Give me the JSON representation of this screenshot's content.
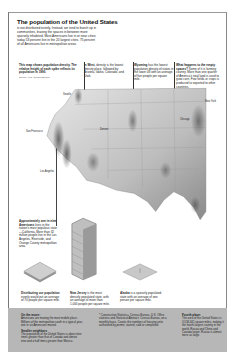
{
  "header": {
    "title": "The population of the United States",
    "intro": "is not distributed evenly. Instead, we tend to bunch up in communities, leaving the spaces in between more sparsely inhabited. Most Americans live in or near cities; today 53 percent live in the 20 largest cities. 75 percent of all Americans live in metropolitan areas."
  },
  "captions": [
    {
      "id": "map-intro",
      "bold": "This map shows population density. The relative height of each spike reflects its population in 1990.",
      "text": "",
      "source": "Source: U.S. Census Bureau"
    },
    {
      "id": "mid-west",
      "bold": "In West,",
      "text": "density is the lowest density place, followed by Arizona, Idaho, Colorado, and Utah."
    },
    {
      "id": "wyoming",
      "bold": "Wyoming",
      "text": "has the lowest population density of states in the lower 48 with an average of five people per square mile."
    },
    {
      "id": "what-happens",
      "bold": "What happens to the empty spaces?",
      "text": "Some of it is farming country. More than one quarter of America's total land is used to grow corn. Few fields or crops is produced to exported to other countries."
    },
    {
      "id": "manhattan",
      "bold": "Approximately one in nine Americans",
      "text": "lives in the nation's most populous state—California. More than 32 million people live in the Los Angeles, Riverside, and Orange County metropolitan area."
    },
    {
      "id": "distributing",
      "bold": "Distributing our population",
      "text": "evenly would put an average of 70 people per square mile."
    },
    {
      "id": "new-jersey",
      "bold": "New Jersey",
      "text": "is the most densely populated state, with an average of more than 1,000 people per square mile."
    },
    {
      "id": "alaska",
      "bold": "Alaska",
      "text": "is a sparsely populated state with an average of one person per square mile."
    }
  ],
  "map": {
    "labels": [
      "Seattle",
      "Portland",
      "San Francisco",
      "Los Angeles",
      "San Diego",
      "Phoenix",
      "Denver",
      "Salt Lake City",
      "Dallas",
      "Houston",
      "Chicago",
      "Minneapolis",
      "Kansas City",
      "Atlanta",
      "Miami",
      "New York"
    ]
  },
  "footer": {
    "left": {
      "heading1": "On the move:",
      "text1": "Americans are moving the most mobile place. Millions of the metropolitan south in a typical year, one in six Americans moved.",
      "heading2": "Smaller neighbors",
      "text2": "The population of the United States is about nine times greater than that of Canada and almost nine and a half times greater than Mexico."
    },
    "center": {
      "text": "* Construction Statistics. Census Bureau. U.S. Office statistics and Statistical Abstract. Census Bureau, on a monthly basis. Counts the numbers of housing units authorized by permit, started, sold or completed."
    },
    "right": {
      "heading": "Fourth place:",
      "text": "The area of the United States is 3,536,341 square miles, making it the fourth largest country in the world. Russia and China and Canada larger. Russia is almost twice as large."
    }
  },
  "colors": {
    "footer_bg": "#b7b7b7",
    "map_light": "#dcdcdc",
    "map_dark": "#6e6e6e",
    "border": "#777777"
  }
}
